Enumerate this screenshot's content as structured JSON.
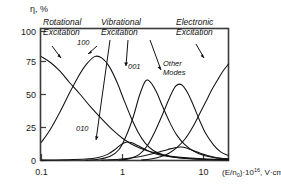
{
  "chart_data": {
    "type": "line",
    "title": "",
    "xlabel": "(E/n0)·10⁻¹⁶, V·cm²",
    "xlabel_parts": {
      "base": "(E/n",
      "sub": "0",
      "mid": ")·10",
      "sup": "16",
      "tail": ", V·cm",
      "tail_sup": "2"
    },
    "ylabel": "η, %",
    "xscale": "log",
    "yscale": "linear",
    "xlim": [
      0.1,
      20
    ],
    "ylim": [
      0,
      108
    ],
    "grid": false,
    "legend_position": "inline-annotations",
    "xticks": [
      "0.1",
      "1",
      "10"
    ],
    "xtick_values": [
      0.1,
      1,
      10
    ],
    "yticks": [
      "0",
      "25",
      "50",
      "75",
      "100"
    ],
    "ytick_values": [
      0,
      25,
      50,
      75,
      100
    ],
    "series": [
      {
        "name": "Rotational Excitation",
        "label": "Rotational Excitation",
        "peak_x": 0.1,
        "peak_y": 85,
        "points": [
          [
            0.1,
            85
          ],
          [
            0.13,
            80
          ],
          [
            0.17,
            73
          ],
          [
            0.22,
            64
          ],
          [
            0.3,
            54
          ],
          [
            0.4,
            44
          ],
          [
            0.55,
            34
          ],
          [
            0.75,
            25
          ],
          [
            1.0,
            18
          ],
          [
            1.4,
            12
          ],
          [
            2.0,
            8
          ],
          [
            3.0,
            5
          ],
          [
            4.5,
            3
          ],
          [
            7.0,
            2
          ],
          [
            11.0,
            1.2
          ],
          [
            20.0,
            0.8
          ]
        ]
      },
      {
        "name": "100 mode",
        "label": "100",
        "peak_x": 0.45,
        "peak_y": 85,
        "points": [
          [
            0.1,
            15
          ],
          [
            0.13,
            26
          ],
          [
            0.17,
            40
          ],
          [
            0.22,
            55
          ],
          [
            0.28,
            68
          ],
          [
            0.35,
            78
          ],
          [
            0.45,
            85
          ],
          [
            0.55,
            84
          ],
          [
            0.68,
            77
          ],
          [
            0.85,
            64
          ],
          [
            1.0,
            52
          ],
          [
            1.25,
            36
          ],
          [
            1.55,
            23
          ],
          [
            1.9,
            14
          ],
          [
            2.4,
            8
          ],
          [
            3.2,
            4.5
          ],
          [
            4.5,
            2.5
          ],
          [
            7.0,
            1.4
          ],
          [
            11.0,
            0.9
          ],
          [
            20.0,
            0.6
          ]
        ]
      },
      {
        "name": "010 mode",
        "label": "010",
        "peak_x": 1.1,
        "peak_y": 15,
        "points": [
          [
            0.1,
            0.3
          ],
          [
            0.2,
            0.6
          ],
          [
            0.35,
            1.2
          ],
          [
            0.5,
            2.5
          ],
          [
            0.65,
            5
          ],
          [
            0.8,
            9
          ],
          [
            0.95,
            13
          ],
          [
            1.1,
            15
          ],
          [
            1.3,
            14.5
          ],
          [
            1.55,
            12
          ],
          [
            1.9,
            9
          ],
          [
            2.4,
            6
          ],
          [
            3.2,
            4
          ],
          [
            4.5,
            2.5
          ],
          [
            7.0,
            1.5
          ],
          [
            11.0,
            0.9
          ],
          [
            20.0,
            0.5
          ]
        ]
      },
      {
        "name": "001 mode",
        "label": "001",
        "peak_x": 1.9,
        "peak_y": 65,
        "points": [
          [
            0.35,
            0.3
          ],
          [
            0.5,
            1.0
          ],
          [
            0.7,
            3.5
          ],
          [
            0.9,
            9
          ],
          [
            1.1,
            20
          ],
          [
            1.35,
            36
          ],
          [
            1.6,
            53
          ],
          [
            1.9,
            65
          ],
          [
            2.2,
            64
          ],
          [
            2.6,
            56
          ],
          [
            3.1,
            44
          ],
          [
            3.8,
            31
          ],
          [
            4.6,
            21
          ],
          [
            5.8,
            13
          ],
          [
            7.5,
            7.5
          ],
          [
            10.0,
            4
          ],
          [
            14.0,
            2
          ],
          [
            20.0,
            1.2
          ]
        ]
      },
      {
        "name": "Other Modes",
        "label": "Other Modes",
        "peak_x": 4.5,
        "peak_y": 62,
        "points": [
          [
            0.9,
            0.4
          ],
          [
            1.2,
            1.5
          ],
          [
            1.6,
            5
          ],
          [
            2.0,
            12
          ],
          [
            2.5,
            24
          ],
          [
            3.1,
            38
          ],
          [
            3.8,
            52
          ],
          [
            4.5,
            61
          ],
          [
            5.3,
            62
          ],
          [
            6.2,
            56
          ],
          [
            7.3,
            46
          ],
          [
            8.8,
            33
          ],
          [
            10.5,
            22
          ],
          [
            13.0,
            13
          ],
          [
            16.0,
            7
          ],
          [
            20.0,
            4
          ]
        ]
      },
      {
        "name": "Other Modes low hump",
        "label": "",
        "peak_x": 5.0,
        "peak_y": 11,
        "points": [
          [
            0.55,
            0.3
          ],
          [
            0.9,
            1.0
          ],
          [
            1.4,
            2.5
          ],
          [
            2.0,
            4.5
          ],
          [
            2.8,
            7
          ],
          [
            3.6,
            9
          ],
          [
            4.4,
            10.5
          ],
          [
            5.2,
            11
          ],
          [
            6.2,
            10
          ],
          [
            7.5,
            8
          ],
          [
            9.0,
            6
          ],
          [
            11.0,
            4
          ],
          [
            14.0,
            2.5
          ],
          [
            20.0,
            1.2
          ]
        ]
      },
      {
        "name": "Electronic Excitation",
        "label": "Electronic Excitation",
        "peak_x": 20,
        "peak_y": 80,
        "points": [
          [
            1.7,
            0.4
          ],
          [
            2.2,
            1.2
          ],
          [
            2.9,
            3
          ],
          [
            3.7,
            6
          ],
          [
            4.7,
            11
          ],
          [
            5.9,
            18
          ],
          [
            7.2,
            27
          ],
          [
            8.8,
            38
          ],
          [
            10.5,
            48
          ],
          [
            12.5,
            58
          ],
          [
            15.0,
            67
          ],
          [
            17.5,
            74
          ],
          [
            20.0,
            79
          ]
        ]
      }
    ],
    "annotations": [
      {
        "id": "rotational",
        "text_line1": "Rotational",
        "text_line2": "Excitation",
        "text": "Rotational Excitation",
        "x": 0.115,
        "y": 101
      },
      {
        "id": "vibrational",
        "text_line1": "Vibrational",
        "text_line2": "Excitation",
        "text": "Vibrational Excitation",
        "x": 1.0,
        "y": 101
      },
      {
        "id": "electronic",
        "text_line1": "Electronic",
        "text_line2": "Excitation",
        "text": "Electronic Excitation",
        "x": 9.0,
        "y": 101
      },
      {
        "id": "mode-100",
        "text": "100",
        "x": 0.62,
        "y": 88
      },
      {
        "id": "mode-010",
        "text": "010",
        "x": 0.72,
        "y": 24
      },
      {
        "id": "mode-001",
        "text": "001",
        "x": 2.0,
        "y": 72
      },
      {
        "id": "mode-other",
        "text_line1": "Other",
        "text_line2": "Modes",
        "text": "Other Modes",
        "x": 4.6,
        "y": 74
      }
    ]
  },
  "colors": {
    "background": "#ffffff",
    "curve": "#111111",
    "frame": "#3b3b3b",
    "text": "#1a1a1a"
  }
}
